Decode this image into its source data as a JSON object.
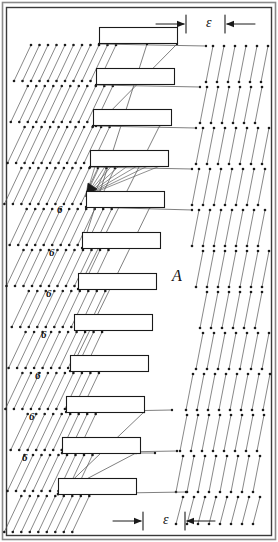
{
  "figure": {
    "kind": "patent-line-drawing",
    "width": 278,
    "height": 542,
    "background_color": "#ffffff",
    "line_color": "#1a1a1a",
    "frame": {
      "stroke": "#3a3a3a",
      "x": 6,
      "y": 7,
      "width": 265,
      "height": 528,
      "outer_stroke": "#8a8a8a"
    }
  },
  "labels": {
    "reference_6": "6",
    "region_A": "A",
    "epsilon": "ε",
    "six_positions": [
      {
        "x": 57,
        "y": 204
      },
      {
        "x": 49,
        "y": 247
      },
      {
        "x": 46,
        "y": 288
      },
      {
        "x": 41,
        "y": 329
      },
      {
        "x": 35,
        "y": 370
      },
      {
        "x": 29,
        "y": 411
      },
      {
        "x": 22,
        "y": 452
      }
    ],
    "a_position": {
      "x": 172,
      "y": 268
    },
    "epsilon_positions": [
      {
        "x": 206,
        "y": 16
      },
      {
        "x": 163,
        "y": 513
      }
    ]
  },
  "bars": {
    "count": 12,
    "width": 78,
    "height": 16,
    "pitch": 41,
    "fill": "#ffffff",
    "stroke": "#1a1a1a",
    "items": [
      {
        "index": 1,
        "x": 99,
        "y": 27
      },
      {
        "index": 2,
        "x": 96,
        "y": 68
      },
      {
        "index": 3,
        "x": 93,
        "y": 109
      },
      {
        "index": 4,
        "x": 90,
        "y": 150
      },
      {
        "index": 5,
        "x": 86,
        "y": 191
      },
      {
        "index": 6,
        "x": 82,
        "y": 232
      },
      {
        "index": 7,
        "x": 78,
        "y": 273
      },
      {
        "index": 8,
        "x": 74,
        "y": 314
      },
      {
        "index": 9,
        "x": 70,
        "y": 355
      },
      {
        "index": 10,
        "x": 66,
        "y": 396
      },
      {
        "index": 11,
        "x": 62,
        "y": 437
      },
      {
        "index": 12,
        "x": 58,
        "y": 478
      }
    ]
  },
  "left_field": {
    "description": "hatch lines slanting down-left with endpoint dots",
    "rows": 12,
    "row_pitch": 41,
    "first_row_top": 45,
    "line_count_per_row": 12,
    "spacing": 8.5,
    "slant_dx": -17,
    "dot_radius": 1.3
  },
  "right_field": {
    "description": "near-vertical hatch lines with endpoint dots",
    "rows": 4,
    "row_pitch": 41,
    "line_count_per_row": 7,
    "spacing": 11,
    "slant_dx": -7,
    "dot_radius": 1.3
  },
  "connectors": {
    "description": "long diagonal tie lines spanning between bars and fields",
    "count": 8,
    "stroke": "#555555"
  },
  "convergence": {
    "description": "fan of lines converging to an arrowhead at left edge of bar 5",
    "x": 86,
    "y": 196,
    "fan_count": 9
  },
  "dimension_callouts": [
    {
      "id": "top",
      "symbol": "ε",
      "left_tick_x": 186,
      "right_tick_x": 225,
      "y": 24,
      "arrow_direction_left": "right",
      "arrow_direction_right": "left"
    },
    {
      "id": "bottom",
      "symbol": "ε",
      "left_tick_x": 143,
      "right_tick_x": 185,
      "y": 521,
      "arrow_direction_left": "right",
      "arrow_direction_right": "left"
    }
  ]
}
